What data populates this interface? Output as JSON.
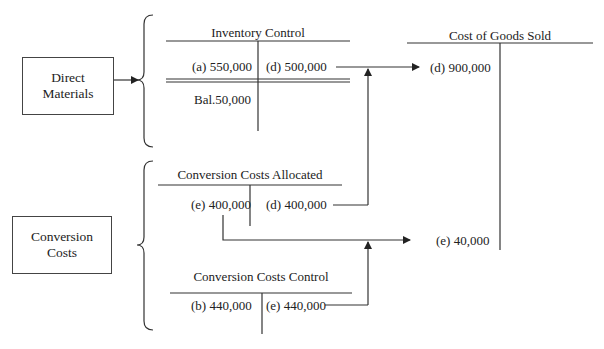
{
  "diagram": {
    "type": "t-account-flow",
    "cost_sources": [
      {
        "id": "direct-materials",
        "label_line1": "Direct",
        "label_line2": "Materials"
      },
      {
        "id": "conversion-costs",
        "label_line1": "Conversion",
        "label_line2": "Costs"
      }
    ],
    "accounts": {
      "inventory_control": {
        "title": "Inventory Control",
        "debit": "(a) 550,000",
        "credit": "(d) 500,000",
        "balance": "Bal.50,000"
      },
      "conversion_costs_allocated": {
        "title": "Conversion Costs Allocated",
        "debit": "(e) 400,000",
        "credit": "(d) 400,000"
      },
      "conversion_costs_control": {
        "title": "Conversion Costs Control",
        "debit": "(b) 440,000",
        "credit": "(e) 440,000"
      },
      "cost_of_goods_sold": {
        "title": "Cost of Goods Sold",
        "debit_1": "(d) 900,000",
        "debit_2": "(e) 40,000"
      }
    },
    "flows": [
      {
        "from": "Inventory Control (d) 500,000",
        "to": "Cost of Goods Sold (d) 900,000"
      },
      {
        "from": "Conversion Costs Allocated (d) 400,000",
        "to": "Cost of Goods Sold (d) 900,000"
      },
      {
        "from": "Conversion Costs Allocated (e) 400,000",
        "to": "Cost of Goods Sold (e) 40,000"
      },
      {
        "from": "Conversion Costs Control (e) 440,000",
        "to": "Cost of Goods Sold (e) 40,000"
      }
    ],
    "colors": {
      "line": "#333333",
      "text": "#222222",
      "background": "#ffffff"
    }
  }
}
